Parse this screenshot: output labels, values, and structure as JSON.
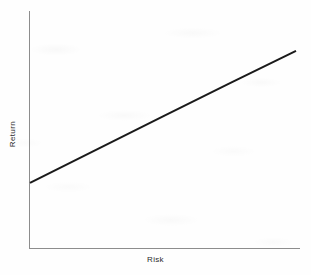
{
  "chart_data": {
    "type": "line",
    "title": "",
    "subtitle": "",
    "xlabel": "Risk",
    "ylabel": "Return",
    "grid": false,
    "legend": null,
    "xlim": [
      0,
      1
    ],
    "ylim": [
      0,
      1
    ],
    "axis_ticks": {
      "x": [],
      "y": []
    },
    "series": [
      {
        "name": "Risk-return tradeoff",
        "x": [
          0.0,
          0.25,
          0.5,
          0.75,
          1.0
        ],
        "y": [
          0.275,
          0.415,
          0.555,
          0.695,
          0.832
        ],
        "color": "#1a1a1a",
        "linewidth": 2,
        "style": "solid",
        "markers": false
      }
    ],
    "annotations": []
  },
  "figure": {
    "axis_color": "#8d8d8d",
    "line_color": "#1a1a1a",
    "background_color": "#fefefe",
    "label_color": "#2b2b2b"
  },
  "labels": {
    "y_axis": "Return",
    "x_axis": "Risk"
  }
}
